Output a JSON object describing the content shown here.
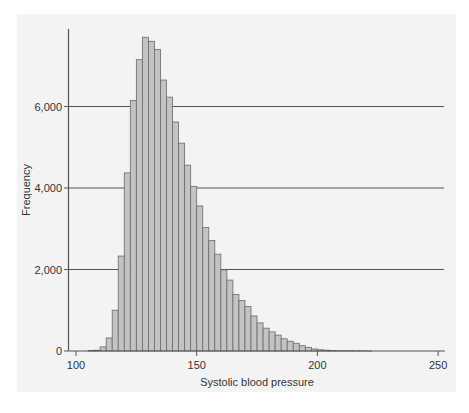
{
  "chart_data": {
    "type": "bar",
    "subtype": "histogram",
    "title": "",
    "xlabel": "Systolic blood pressure",
    "ylabel": "Frequency",
    "xlim": [
      100,
      250
    ],
    "ylim": [
      0,
      7800
    ],
    "x_ticks": [
      100,
      150,
      200,
      250
    ],
    "x_tick_labels": [
      "100",
      "150",
      "200",
      "250"
    ],
    "y_ticks": [
      0,
      2000,
      4000,
      6000
    ],
    "y_tick_labels": [
      "0",
      "2,000",
      "4,000",
      "6,000"
    ],
    "gridlines": [
      2000,
      4000,
      6000
    ],
    "grid": true,
    "legend": null,
    "bin_width": 2.5,
    "bins": [
      105,
      107.5,
      110,
      112.5,
      115,
      117.5,
      120,
      122.5,
      125,
      127.5,
      130,
      132.5,
      135,
      137.5,
      140,
      142.5,
      145,
      147.5,
      150,
      152.5,
      155,
      157.5,
      160,
      162.5,
      165,
      167.5,
      170,
      172.5,
      175,
      177.5,
      180,
      182.5,
      185,
      187.5,
      190,
      192.5,
      195,
      197.5,
      200,
      202.5,
      205,
      207.5,
      210,
      212.5,
      215,
      217.5,
      220
    ],
    "values": [
      10,
      20,
      100,
      320,
      1000,
      2330,
      4370,
      6150,
      7150,
      7700,
      7600,
      7400,
      6650,
      6230,
      5620,
      5100,
      4560,
      4040,
      3560,
      3030,
      2710,
      2375,
      1990,
      1740,
      1390,
      1240,
      1090,
      860,
      690,
      560,
      470,
      390,
      300,
      240,
      190,
      130,
      90,
      50,
      30,
      20,
      12,
      8,
      6,
      5,
      4,
      3,
      2
    ],
    "colors": {
      "bar_fill": "#c3c3c3",
      "bar_edge": "#6a6a6a",
      "grid": "#555555",
      "axis": "#555555",
      "panel": "#f3f3f3"
    }
  }
}
